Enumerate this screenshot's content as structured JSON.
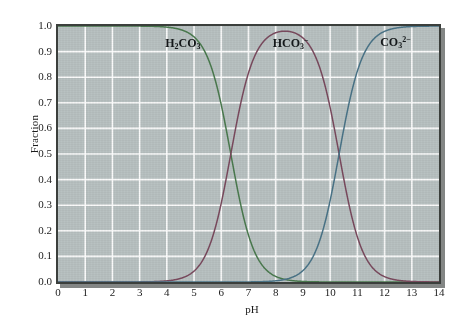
{
  "figure": {
    "background_color": "#ffffff",
    "panel_color": "#b9c2c2",
    "grid_color": "#ffffff",
    "frame_color": "#3b3f3c"
  },
  "chart_data": {
    "type": "line",
    "title": "",
    "subtitle": "",
    "xlabel": "pH",
    "ylabel": "Fraction",
    "xlim": [
      0,
      14
    ],
    "ylim": [
      0.0,
      1.0
    ],
    "grid": true,
    "legend_position": "inline-annotations",
    "xticks": [
      "0",
      "1",
      "2",
      "3",
      "4",
      "5",
      "6",
      "7",
      "8",
      "9",
      "10",
      "11",
      "12",
      "13",
      "14"
    ],
    "xtick_values": [
      0,
      1,
      2,
      3,
      4,
      5,
      6,
      7,
      8,
      9,
      10,
      11,
      12,
      13,
      14
    ],
    "yticks": [
      "0.0",
      "0.1",
      "0.2",
      "0.3",
      "0.4",
      "0.5",
      "0.6",
      "0.7",
      "0.8",
      "0.9",
      "1.0"
    ],
    "ytick_values": [
      0.0,
      0.1,
      0.2,
      0.3,
      0.4,
      0.5,
      0.6,
      0.7,
      0.8,
      0.9,
      1.0
    ],
    "model": "carbonic acid diprotic speciation",
    "pKa1": 6.35,
    "pKa2": 10.33,
    "crossing_points": [
      {
        "label": "H2CO3 = HCO3-",
        "pH": 6.35,
        "fraction": 0.5
      },
      {
        "label": "HCO3- = CO3 2-",
        "pH": 10.33,
        "fraction": 0.5
      }
    ],
    "x": [
      0,
      0.5,
      1,
      1.5,
      2,
      2.5,
      3,
      3.5,
      4,
      4.5,
      5,
      5.5,
      6,
      6.35,
      6.5,
      7,
      7.5,
      8,
      8.35,
      8.5,
      9,
      9.5,
      10,
      10.33,
      10.5,
      11,
      11.5,
      12,
      12.5,
      13,
      13.5,
      14
    ],
    "series": [
      {
        "name": "H2CO3",
        "label_html": "H<sub>2</sub>CO<sub>3</sub>",
        "color": "#4a7a4e",
        "values": [
          1.0,
          1.0,
          1.0,
          1.0,
          1.0,
          1.0,
          0.999,
          0.999,
          0.996,
          0.986,
          0.957,
          0.876,
          0.691,
          0.5,
          0.415,
          0.181,
          0.066,
          0.022,
          0.0099,
          0.007,
          0.0022,
          0.0007,
          0.0002,
          0.0001,
          7e-05,
          2e-05,
          6e-06,
          2e-06,
          5e-07,
          1e-07,
          3e-08,
          1e-08
        ]
      },
      {
        "name": "HCO3-",
        "label_html": "HCO<sub>3</sub><sup>−</sup>",
        "color": "#7a4a5e",
        "values": [
          4e-07,
          1.3e-06,
          4e-06,
          1.3e-05,
          4e-05,
          0.00013,
          0.0004,
          0.0013,
          0.0042,
          0.0134,
          0.0417,
          0.124,
          0.308,
          0.5,
          0.584,
          0.818,
          0.933,
          0.975,
          0.983,
          0.984,
          0.977,
          0.947,
          0.854,
          0.5,
          0.675,
          0.399,
          0.175,
          0.061,
          0.02,
          0.0065,
          0.0021,
          0.00066
        ]
      },
      {
        "name": "CO3 2-",
        "label_html": "CO<sub>3</sub><sup>2−</sup>",
        "color": "#4a7488",
        "values": [
          0.0,
          0.0,
          0.0,
          0.0,
          0.0,
          0.0,
          0.0,
          0.0,
          0.0,
          0.0,
          0.0,
          0.0,
          1e-07,
          6e-07,
          9e-07,
          6.6e-06,
          2.35e-05,
          7.77e-05,
          0.000175,
          0.000247,
          0.000781,
          0.00239,
          0.00697,
          0.5,
          0.0229,
          0.0684,
          0.187,
          0.418,
          0.692,
          0.879,
          0.959,
          0.987
        ]
      }
    ],
    "annotations": [
      {
        "name": "H2CO3",
        "text_html": "H<sub>2</sub>CO<sub>3</sub>",
        "pH": 4.6,
        "fraction": 0.925
      },
      {
        "name": "HCO3-",
        "text_html": "HCO<sub>3</sub><sup>−</sup>",
        "pH": 8.55,
        "fraction": 0.925
      },
      {
        "name": "CO3 2-",
        "text_html": "CO<sub>3</sub><sup>2−</sup>",
        "pH": 12.5,
        "fraction": 0.93
      }
    ]
  }
}
